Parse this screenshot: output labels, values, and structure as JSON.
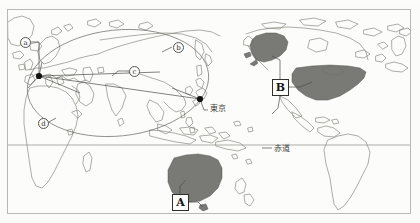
{
  "figure": {
    "type": "world-map-diagram",
    "projection": "mercator",
    "caption": "",
    "frame_color": "#b9b9b4",
    "background_color": "#fcfcfa",
    "land_outline_color": "#6f6f6a",
    "shaded_land_color": "#6e6e6b",
    "route_line_color": "#5a5a56",
    "node_color": "#111111"
  },
  "circle_labels": [
    {
      "id": "a",
      "text": "ⓐ",
      "glyph": "a",
      "x": 20,
      "y": 37
    },
    {
      "id": "b",
      "text": "ⓑ",
      "glyph": "b",
      "x": 173,
      "y": 42
    },
    {
      "id": "c",
      "text": "ⓒ",
      "glyph": "c",
      "x": 129,
      "y": 66
    },
    {
      "id": "d",
      "text": "ⓓ",
      "glyph": "d",
      "x": 38,
      "y": 118
    }
  ],
  "box_labels": [
    {
      "id": "A",
      "text": "A",
      "x": 172,
      "y": 194,
      "region": "australia"
    },
    {
      "id": "B",
      "text": "B",
      "x": 272,
      "y": 79,
      "region": "united-states"
    }
  ],
  "text_labels": [
    {
      "id": "tokyo",
      "text": "東京",
      "x": 210,
      "y": 108,
      "lang": "ja"
    },
    {
      "id": "equator",
      "text": "赤道",
      "x": 272,
      "y": 148,
      "lang": "ja"
    }
  ],
  "nodes": [
    {
      "id": "europe-hub",
      "label": "",
      "x": 39,
      "y": 76
    },
    {
      "id": "tokyo-node",
      "label": "東京",
      "x": 200,
      "y": 99
    }
  ],
  "shaded_regions": [
    {
      "id": "alaska",
      "label": "B",
      "color": "#6e6e6b"
    },
    {
      "id": "continental-usa",
      "label": "B",
      "color": "#6e6e6b"
    },
    {
      "id": "australia",
      "label": "A",
      "color": "#6e6e6b"
    },
    {
      "id": "tasmania",
      "label": "A",
      "color": "#6e6e6b"
    }
  ],
  "features": {
    "equator_line": true,
    "ellipse_overlay": true,
    "route_lines": true
  }
}
